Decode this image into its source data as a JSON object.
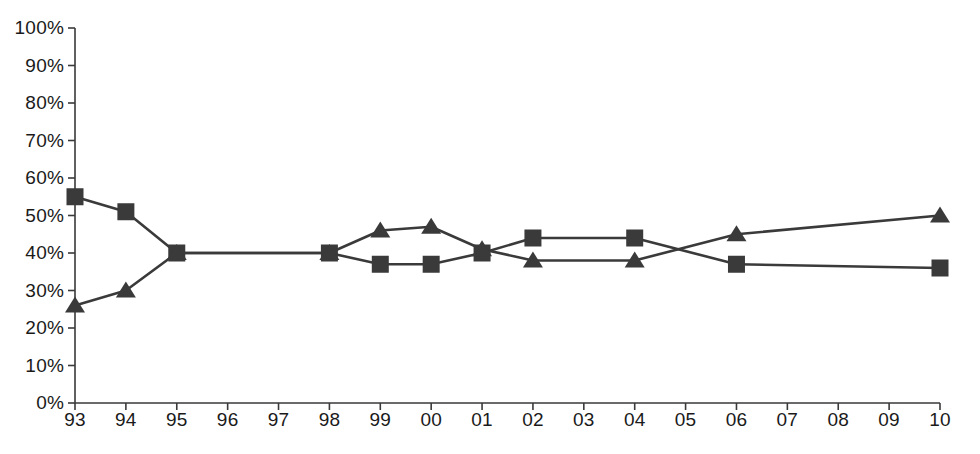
{
  "chart_data": {
    "type": "line",
    "title": "",
    "subtitle": "",
    "xlabel": "",
    "ylabel": "",
    "ylim": [
      0,
      100
    ],
    "yticks": [
      "0%",
      "10%",
      "20%",
      "30%",
      "40%",
      "50%",
      "60%",
      "70%",
      "80%",
      "90%",
      "100%"
    ],
    "ytick_values": [
      0,
      10,
      20,
      30,
      40,
      50,
      60,
      70,
      80,
      90,
      100
    ],
    "grid": false,
    "legend": "none",
    "categories": [
      "93",
      "94",
      "95",
      "96",
      "97",
      "98",
      "99",
      "00",
      "01",
      "02",
      "03",
      "04",
      "05",
      "06",
      "07",
      "08",
      "09",
      "10"
    ],
    "series": [
      {
        "name": "square-series",
        "marker": "square",
        "color": "#3a3a3a",
        "values": [
          55,
          51,
          40,
          null,
          null,
          40,
          37,
          37,
          40,
          44,
          null,
          44,
          null,
          37,
          null,
          null,
          null,
          36
        ]
      },
      {
        "name": "triangle-series",
        "marker": "triangle",
        "color": "#3a3a3a",
        "values": [
          26,
          30,
          40,
          null,
          null,
          40,
          46,
          47,
          41,
          38,
          null,
          38,
          null,
          45,
          null,
          null,
          null,
          50
        ]
      }
    ]
  },
  "axis": {
    "tick_color": "#3a3a3a",
    "axis_color": "#3a3a3a",
    "label_color": "#1a1a1a"
  }
}
